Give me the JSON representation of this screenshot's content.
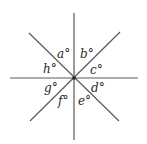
{
  "figure": {
    "center": {
      "x": 74,
      "y": 78
    },
    "lines": [
      {
        "id": "vertical",
        "x1": 74,
        "y1": 13,
        "x2": 74,
        "y2": 140
      },
      {
        "id": "horizontal",
        "x1": 10,
        "y1": 78,
        "x2": 138,
        "y2": 78
      },
      {
        "id": "diag-down",
        "x1": 29,
        "y1": 33,
        "x2": 119,
        "y2": 121
      },
      {
        "id": "diag-up",
        "x1": 30,
        "y1": 121,
        "x2": 120,
        "y2": 32
      }
    ],
    "labels": [
      {
        "id": "a",
        "text": "a°",
        "x": 57,
        "y": 58
      },
      {
        "id": "b",
        "text": "b°",
        "x": 80,
        "y": 58
      },
      {
        "id": "c",
        "text": "c°",
        "x": 90,
        "y": 74
      },
      {
        "id": "d",
        "text": "d°",
        "x": 91,
        "y": 92
      },
      {
        "id": "e",
        "text": "e°",
        "x": 78,
        "y": 105
      },
      {
        "id": "f",
        "text": "f°",
        "x": 58,
        "y": 105
      },
      {
        "id": "g",
        "text": "g°",
        "x": 44,
        "y": 92
      },
      {
        "id": "h",
        "text": "h°",
        "x": 43,
        "y": 73
      }
    ],
    "colors": {
      "line": "#5a5a5a",
      "text": "#2a2a2a",
      "background": "#ffffff"
    }
  }
}
